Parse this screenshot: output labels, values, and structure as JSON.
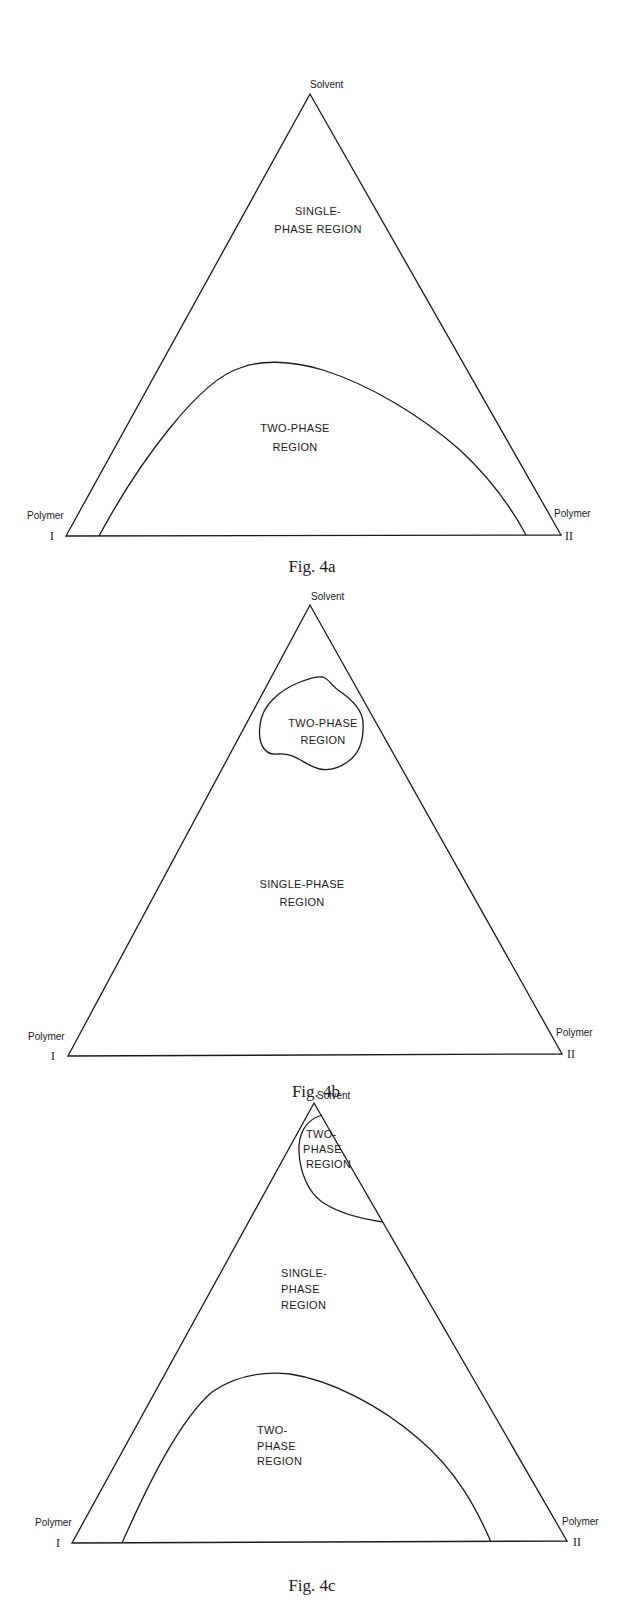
{
  "figures": [
    {
      "id": "4a",
      "caption": "Fig. 4a",
      "vertices": {
        "top": "Solvent",
        "left": {
          "name": "Polymer",
          "numeral": "I"
        },
        "right": {
          "name": "Polymer",
          "numeral": "II"
        }
      },
      "regions": [
        {
          "lines": [
            "SINGLE-",
            "PHASE REGION"
          ]
        },
        {
          "lines": [
            "TWO-PHASE",
            "REGION"
          ]
        }
      ]
    },
    {
      "id": "4b",
      "caption": "Fig. 4b",
      "vertices": {
        "top": "Solvent",
        "left": {
          "name": "Polymer",
          "numeral": "I"
        },
        "right": {
          "name": "Polymer",
          "numeral": "II"
        }
      },
      "regions": [
        {
          "lines": [
            "TWO-PHASE",
            "REGION"
          ]
        },
        {
          "lines": [
            "SINGLE-PHASE",
            "REGION"
          ]
        }
      ]
    },
    {
      "id": "4c",
      "caption": "Fig. 4c",
      "vertices": {
        "top": "Solvent",
        "left": {
          "name": "Polymer",
          "numeral": "I"
        },
        "right": {
          "name": "Polymer",
          "numeral": "II"
        }
      },
      "regions": [
        {
          "lines": [
            "TWO-",
            "PHASE",
            "REGION"
          ]
        },
        {
          "lines": [
            "SINGLE-",
            "PHASE",
            "REGION"
          ]
        },
        {
          "lines": [
            "TWO-",
            "PHASE",
            "REGION"
          ]
        }
      ]
    }
  ],
  "colors": {
    "ink": "#1a1a1a",
    "paper": "#ffffff"
  }
}
